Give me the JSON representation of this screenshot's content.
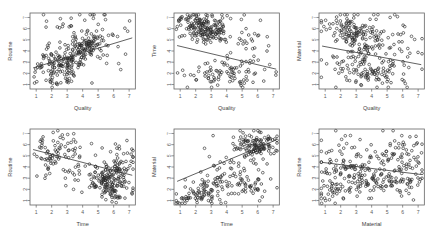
{
  "figure": {
    "truncated_header_text": "——  ———— ——— ——  ———— ————— ———— — ————",
    "rows": 2,
    "cols": 3,
    "point_color": "#2b2b2b",
    "line_color": "#3a3a3a",
    "frame_color": "#636363",
    "background": "#ffffff"
  },
  "chart_data": [
    {
      "type": "scatter",
      "panel": "top-left",
      "title": "",
      "xlabel": "Quality",
      "ylabel": "Routine",
      "xlim": [
        0.6,
        7.4
      ],
      "ylim": [
        0.6,
        7.4
      ],
      "xticks": [
        1,
        2,
        3,
        4,
        5,
        6,
        7
      ],
      "yticks": [
        1,
        2,
        3,
        4,
        5,
        6,
        7
      ],
      "xtick_labels": [
        "1",
        "2",
        "3",
        "4",
        "5",
        "6",
        "7"
      ],
      "ytick_labels": [
        "1",
        "2",
        "3",
        "4",
        "5",
        "6",
        "7"
      ],
      "grid": false,
      "legend": null,
      "marker": "open-circle",
      "n_points": 300,
      "fit": {
        "type": "linear",
        "slope": 0.42,
        "intercept": 2.15,
        "x_from": 0.8,
        "x_to": 7.2
      },
      "x": [
        2.6,
        2.9,
        3.1,
        2.4,
        3.3,
        2.2,
        2.8,
        3.5,
        2.7,
        3.0,
        2.5,
        3.2,
        2.35,
        2.95,
        3.4,
        4.2,
        4.5,
        4.0,
        4.35,
        4.6,
        3.8,
        4.1,
        4.45,
        4.7,
        3.95,
        2.1,
        1.8,
        1.5,
        1.2,
        2.0,
        1.65,
        1.35,
        2.15,
        1.9,
        1.45,
        5.0,
        5.3,
        4.9,
        5.5,
        5.15,
        4.8,
        5.4,
        5.6,
        5.05,
        4.95,
        6.0,
        6.3,
        5.8,
        6.5,
        6.15,
        3.6,
        3.45,
        3.7,
        3.55,
        3.25,
        2.45,
        2.75,
        3.05,
        2.65,
        2.85,
        4.25,
        4.15,
        4.55,
        4.65,
        4.05,
        1.1,
        1.3,
        1.55,
        1.75,
        1.95,
        3.15,
        3.35,
        2.55,
        2.25,
        2.05,
        4.75,
        4.85,
        5.2,
        5.45,
        5.7,
        6.2,
        6.4,
        6.6,
        5.9,
        6.1,
        2.3,
        2.6,
        2.9,
        3.2,
        3.5,
        3.8,
        4.1,
        4.4,
        1.4,
        1.7,
        2.0,
        2.3,
        2.6,
        2.9,
        3.2,
        3.5,
        3.8,
        4.1,
        4.4,
        4.7,
        5.0,
        5.3,
        1.25,
        1.55,
        1.85,
        2.15,
        2.45,
        2.75,
        3.05,
        3.35,
        3.65,
        3.95,
        4.25,
        4.55,
        4.85,
        5.15,
        5.45,
        2.2,
        2.5,
        2.8,
        3.1,
        3.4,
        3.7,
        4.0,
        1.6,
        1.9,
        2.2,
        2.5,
        2.8,
        3.1,
        3.4,
        3.7,
        4.0,
        4.3,
        4.6,
        4.9,
        5.2,
        5.5,
        5.8,
        6.1,
        6.4,
        2.4,
        2.7,
        3.0,
        3.3,
        3.6,
        3.9,
        4.2,
        4.5,
        1.15,
        1.45,
        1.75,
        2.05,
        2.35,
        2.65,
        2.95,
        3.25,
        3.55,
        3.85,
        4.15,
        4.45,
        4.75,
        5.05,
        5.35,
        5.65,
        5.95,
        6.25,
        6.55,
        2.3,
        2.55,
        2.85,
        3.15,
        3.45,
        3.75,
        4.05,
        4.35,
        2.05,
        2.35,
        2.65,
        2.95,
        3.25,
        3.55,
        3.85,
        4.15,
        4.45,
        1.3,
        1.6,
        1.9,
        2.2,
        2.5,
        2.8,
        3.1,
        3.4,
        3.7,
        4.0,
        4.3,
        4.6,
        4.9,
        5.2,
        5.5,
        5.8,
        6.1,
        6.4,
        6.7,
        2.45,
        2.75,
        3.05,
        3.35,
        3.65,
        3.95,
        4.25,
        4.55,
        4.85,
        1.05,
        1.35,
        1.65,
        1.95,
        2.25,
        2.55,
        2.85,
        3.15,
        3.45,
        3.75,
        4.05,
        4.35,
        4.65,
        4.95,
        5.25,
        5.55,
        5.85,
        6.15,
        6.45,
        2.6,
        2.9,
        3.2,
        3.5,
        3.8,
        4.1,
        4.4,
        4.7,
        5.0,
        2.15,
        2.45,
        2.75,
        3.05,
        3.35,
        3.65,
        3.95,
        4.25,
        4.55,
        4.85,
        5.15,
        1.5,
        1.8,
        2.1,
        2.4,
        2.7,
        3.0,
        3.3,
        3.6,
        3.9,
        4.2,
        4.5,
        4.8,
        5.1,
        5.4,
        5.7,
        6.0,
        6.3,
        6.6,
        2.35,
        2.65,
        2.95,
        3.25,
        3.55,
        3.85,
        4.15,
        4.45,
        4.75,
        5.05,
        5.35,
        3.0,
        3.3,
        3.6,
        3.9,
        4.2
      ],
      "y": [
        3.0,
        3.2,
        2.8,
        3.4,
        3.1,
        2.5,
        3.3,
        3.6,
        2.9,
        3.5,
        2.7,
        3.15,
        2.6,
        3.45,
        3.25,
        4.4,
        4.6,
        4.2,
        4.5,
        4.8,
        4.0,
        4.35,
        4.65,
        4.9,
        4.15,
        2.2,
        2.0,
        1.8,
        1.6,
        2.4,
        1.9,
        1.7,
        2.3,
        2.1,
        1.75,
        4.9,
        5.1,
        4.7,
        5.3,
        5.0,
        4.6,
        5.2,
        5.4,
        4.85,
        4.75,
        5.5,
        5.7,
        5.3,
        5.9,
        5.6,
        3.5,
        3.35,
        3.6,
        3.45,
        3.2,
        2.55,
        2.85,
        3.05,
        2.65,
        2.95,
        4.3,
        4.25,
        4.55,
        4.7,
        4.1,
        1.5,
        1.7,
        1.95,
        2.15,
        2.35,
        3.1,
        3.3,
        2.5,
        2.25,
        2.05,
        4.8,
        4.95,
        5.05,
        5.25,
        5.45,
        5.65,
        5.85,
        6.05,
        5.35,
        5.55,
        2.9,
        3.1,
        3.3,
        3.5,
        3.7,
        3.9,
        4.1,
        4.3,
        1.9,
        2.1,
        2.3,
        2.5,
        2.7,
        2.9,
        3.1,
        3.3,
        3.5,
        3.7,
        3.9,
        4.1,
        4.3,
        4.5,
        1.65,
        1.85,
        2.05,
        2.25,
        2.45,
        2.65,
        2.85,
        3.05,
        3.25,
        3.45,
        3.65,
        3.85,
        4.05,
        4.25,
        4.45,
        2.4,
        2.6,
        2.8,
        3.0,
        3.2,
        3.4,
        3.6,
        1.8,
        2.0,
        2.2,
        2.4,
        2.6,
        2.8,
        3.0,
        3.2,
        3.4,
        3.6,
        3.8,
        4.0,
        4.2,
        4.4,
        4.6,
        4.8,
        5.0,
        2.55,
        2.75,
        2.95,
        3.15,
        3.35,
        3.55,
        3.75,
        3.95,
        1.45,
        1.65,
        1.85,
        2.05,
        2.25,
        2.45,
        2.65,
        2.85,
        3.05,
        3.25,
        3.45,
        3.65,
        3.85,
        4.05,
        4.25,
        4.45,
        4.65,
        4.85,
        5.05,
        2.3,
        2.5,
        2.7,
        2.9,
        3.1,
        3.3,
        3.5,
        3.7,
        2.0,
        2.2,
        2.4,
        2.6,
        2.8,
        3.0,
        3.2,
        3.4,
        3.6,
        1.6,
        1.8,
        2.0,
        2.2,
        2.4,
        2.6,
        2.8,
        3.0,
        3.2,
        3.4,
        3.6,
        3.8,
        4.0,
        4.2,
        4.4,
        4.6,
        4.8,
        5.0,
        5.2,
        2.45,
        2.65,
        2.85,
        3.05,
        3.25,
        3.45,
        3.65,
        3.85,
        4.05,
        1.35,
        1.55,
        1.75,
        1.95,
        2.15,
        2.35,
        2.55,
        2.75,
        2.95,
        3.15,
        3.35,
        3.55,
        3.75,
        3.95,
        4.15,
        4.35,
        4.55,
        4.75,
        4.95,
        2.6,
        2.8,
        3.0,
        3.2,
        3.4,
        3.6,
        3.8,
        4.0,
        4.2,
        2.1,
        2.3,
        2.5,
        2.7,
        2.9,
        3.1,
        3.3,
        3.5,
        3.7,
        3.9,
        4.1,
        1.7,
        1.9,
        2.1,
        2.3,
        2.5,
        2.7,
        2.9,
        3.1,
        3.3,
        3.5,
        3.7,
        3.9,
        4.1,
        4.3,
        4.5,
        4.7,
        4.9,
        5.1,
        2.35,
        2.55,
        2.75,
        2.95,
        3.15,
        3.35,
        3.55,
        3.75,
        3.95,
        4.15,
        4.35,
        3.05,
        3.25,
        3.45,
        3.65,
        3.85
      ]
    },
    {
      "type": "scatter",
      "panel": "top-middle",
      "title": "",
      "xlabel": "Quality",
      "ylabel": "Time",
      "xlim": [
        0.6,
        7.4
      ],
      "ylim": [
        0.6,
        7.4
      ],
      "xticks": [
        1,
        2,
        3,
        4,
        5,
        6,
        7
      ],
      "yticks": [
        1,
        2,
        3,
        4,
        5,
        6,
        7
      ],
      "xtick_labels": [
        "1",
        "2",
        "3",
        "4",
        "5",
        "6",
        "7"
      ],
      "ytick_labels": [
        "1",
        "2",
        "3",
        "4",
        "5",
        "6",
        "7"
      ],
      "grid": false,
      "legend": null,
      "marker": "open-circle",
      "n_points": 300,
      "fit": {
        "type": "linear",
        "slope": -0.33,
        "intercept": 4.75,
        "x_from": 0.8,
        "x_to": 7.2
      }
    },
    {
      "type": "scatter",
      "panel": "top-right",
      "title": "",
      "xlabel": "Quality",
      "ylabel": "Material",
      "xlim": [
        0.6,
        7.4
      ],
      "ylim": [
        0.6,
        7.4
      ],
      "xticks": [
        1,
        2,
        3,
        4,
        5,
        6,
        7
      ],
      "yticks": [
        1,
        2,
        3,
        4,
        5,
        6,
        7
      ],
      "xtick_labels": [
        "1",
        "2",
        "3",
        "4",
        "5",
        "6",
        "7"
      ],
      "ytick_labels": [
        "1",
        "2",
        "3",
        "4",
        "5",
        "6",
        "7"
      ],
      "grid": false,
      "legend": null,
      "marker": "open-circle",
      "n_points": 300,
      "fit": {
        "type": "linear",
        "slope": -0.26,
        "intercept": 4.65,
        "x_from": 0.8,
        "x_to": 7.2
      }
    },
    {
      "type": "scatter",
      "panel": "bottom-left",
      "title": "",
      "xlabel": "Time",
      "ylabel": "Routine",
      "xlim": [
        0.6,
        7.4
      ],
      "ylim": [
        0.6,
        7.4
      ],
      "xticks": [
        1,
        2,
        3,
        4,
        5,
        6,
        7
      ],
      "yticks": [
        1,
        2,
        3,
        4,
        5,
        6,
        7
      ],
      "xtick_labels": [
        "1",
        "2",
        "3",
        "4",
        "5",
        "6",
        "7"
      ],
      "ytick_labels": [
        "1",
        "2",
        "3",
        "4",
        "5",
        "6",
        "7"
      ],
      "grid": false,
      "legend": null,
      "marker": "open-circle",
      "n_points": 300,
      "fit": {
        "type": "linear",
        "slope": -0.36,
        "intercept": 5.85,
        "x_from": 0.8,
        "x_to": 7.2
      }
    },
    {
      "type": "scatter",
      "panel": "bottom-middle",
      "title": "",
      "xlabel": "Time",
      "ylabel": "Material",
      "xlim": [
        0.6,
        7.4
      ],
      "ylim": [
        0.6,
        7.4
      ],
      "xticks": [
        1,
        2,
        3,
        4,
        5,
        6,
        7
      ],
      "yticks": [
        1,
        2,
        3,
        4,
        5,
        6,
        7
      ],
      "xtick_labels": [
        "1",
        "2",
        "3",
        "4",
        "5",
        "6",
        "7"
      ],
      "ytick_labels": [
        "1",
        "2",
        "3",
        "4",
        "5",
        "6",
        "7"
      ],
      "grid": false,
      "legend": null,
      "marker": "open-circle",
      "n_points": 300,
      "fit": {
        "type": "linear",
        "slope": 0.58,
        "intercept": 2.25,
        "x_from": 0.8,
        "x_to": 7.2
      }
    },
    {
      "type": "scatter",
      "panel": "bottom-right",
      "title": "",
      "xlabel": "Material",
      "ylabel": "Routine",
      "xlim": [
        0.6,
        7.4
      ],
      "ylim": [
        0.6,
        7.4
      ],
      "xticks": [
        1,
        2,
        3,
        4,
        5,
        6,
        7
      ],
      "yticks": [
        1,
        2,
        3,
        4,
        5,
        6,
        7
      ],
      "xtick_labels": [
        "1",
        "2",
        "3",
        "4",
        "5",
        "6",
        "7"
      ],
      "ytick_labels": [
        "1",
        "2",
        "3",
        "4",
        "5",
        "6",
        "7"
      ],
      "grid": false,
      "legend": null,
      "marker": "open-circle",
      "n_points": 300,
      "fit": {
        "type": "linear",
        "slope": -0.17,
        "intercept": 4.55,
        "x_from": 0.8,
        "x_to": 7.2
      }
    }
  ]
}
